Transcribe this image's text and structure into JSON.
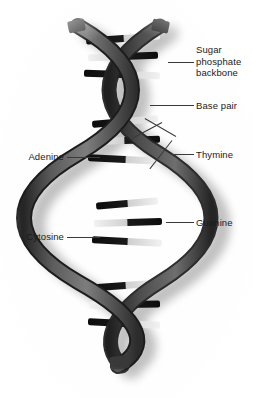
{
  "figure": {
    "background_color": "#ffffff",
    "ribbon_color": "#4a4a4a",
    "ribbon_dark_color": "#2e2e2e",
    "base_dark_color": "#111111",
    "base_light_color": "#d9d9d9",
    "shadow_color": "#b5b5b5",
    "leader_color": "#3a3a3a"
  },
  "labels": {
    "sugar_phosphate_backbone": "Sugar\nphosphate\nbackbone",
    "base_pair": "Base pair",
    "thymine": "Thymine",
    "guanine": "Guanine",
    "adenine": "Adenine",
    "cytosine": "Cytosine"
  }
}
